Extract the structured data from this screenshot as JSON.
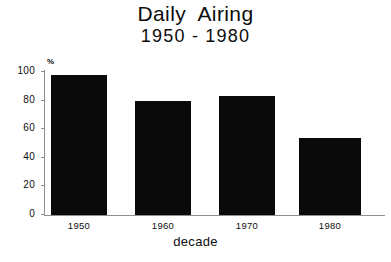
{
  "chart_data": {
    "type": "bar",
    "title": "Daily  Airing",
    "subtitle": "1950 - 1980",
    "categories": [
      "1950",
      "1960",
      "1970",
      "1980"
    ],
    "values": [
      98,
      80,
      83,
      54
    ],
    "xlabel": "decade",
    "ylabel": "%",
    "ylim": [
      0,
      100
    ],
    "yticks": [
      "0",
      "20",
      "40",
      "60",
      "80",
      "100"
    ],
    "grid": false,
    "legend": "none",
    "bar_color": "#0a0a0a",
    "background_color": "#ffffff",
    "axis_color": "#8e8e8e"
  }
}
